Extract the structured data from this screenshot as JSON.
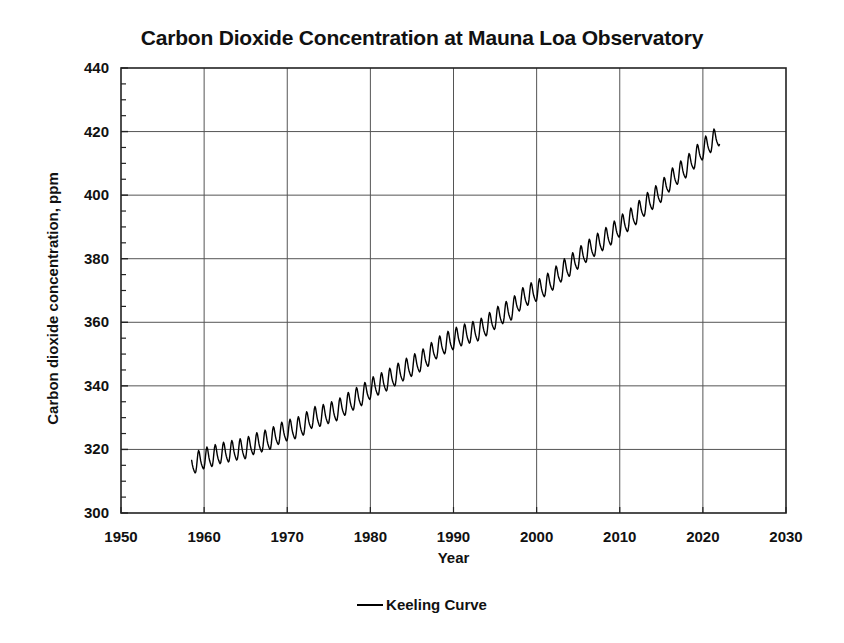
{
  "chart_data": {
    "type": "line",
    "title": "Carbon Dioxide Concentration at Mauna Loa Observatory",
    "xlabel": "Year",
    "ylabel": "Carbon dioxide concentration, ppm",
    "xlim": [
      1950,
      2030
    ],
    "ylim": [
      300,
      440
    ],
    "xticks": [
      1950,
      1960,
      1970,
      1980,
      1990,
      2000,
      2010,
      2020,
      2030
    ],
    "yticks": [
      300,
      320,
      340,
      360,
      380,
      400,
      420,
      440
    ],
    "y_minor_tick_step": 5,
    "grid": true,
    "grid_color": "#555555",
    "frame_color": "#222222",
    "legend_position": "bottom-center",
    "legend": [
      "Keeling Curve"
    ],
    "series": [
      {
        "name": "Keeling Curve",
        "color": "#000000",
        "line_width": 1.4,
        "description": "Monthly mean atmospheric CO2 with annual seasonal oscillation of about 6 ppm peak-to-peak superimposed on a rising trend",
        "seasonal_amplitude_ppm": 3.1,
        "x": [
          1958.5,
          1959,
          1960,
          1961,
          1962,
          1963,
          1964,
          1965,
          1966,
          1967,
          1968,
          1969,
          1970,
          1971,
          1972,
          1973,
          1974,
          1975,
          1976,
          1977,
          1978,
          1979,
          1980,
          1981,
          1982,
          1983,
          1984,
          1985,
          1986,
          1987,
          1988,
          1989,
          1990,
          1991,
          1992,
          1993,
          1994,
          1995,
          1996,
          1997,
          1998,
          1999,
          2000,
          2001,
          2002,
          2003,
          2004,
          2005,
          2006,
          2007,
          2008,
          2009,
          2010,
          2011,
          2012,
          2013,
          2014,
          2015,
          2016,
          2017,
          2018,
          2019,
          2020,
          2021,
          2022
        ],
        "annual_mean_values": [
          315.0,
          315.6,
          316.9,
          317.6,
          318.5,
          319.0,
          319.6,
          320.0,
          321.4,
          322.2,
          323.0,
          324.6,
          325.7,
          326.3,
          327.5,
          329.7,
          330.2,
          331.1,
          332.0,
          333.8,
          335.4,
          336.8,
          338.8,
          340.1,
          341.4,
          343.0,
          344.6,
          346.0,
          347.4,
          349.2,
          351.6,
          353.1,
          354.4,
          355.6,
          356.4,
          357.1,
          358.8,
          360.8,
          362.6,
          363.7,
          366.7,
          368.4,
          369.6,
          371.1,
          373.2,
          375.8,
          377.5,
          379.8,
          381.9,
          383.8,
          385.6,
          387.4,
          389.9,
          391.6,
          393.8,
          396.5,
          398.6,
          400.8,
          404.2,
          406.5,
          408.5,
          411.4,
          414.2,
          416.5,
          418.6
        ]
      }
    ]
  },
  "axis_titles": {
    "x": "Year",
    "y": "Carbon dioxide concentration, ppm"
  }
}
